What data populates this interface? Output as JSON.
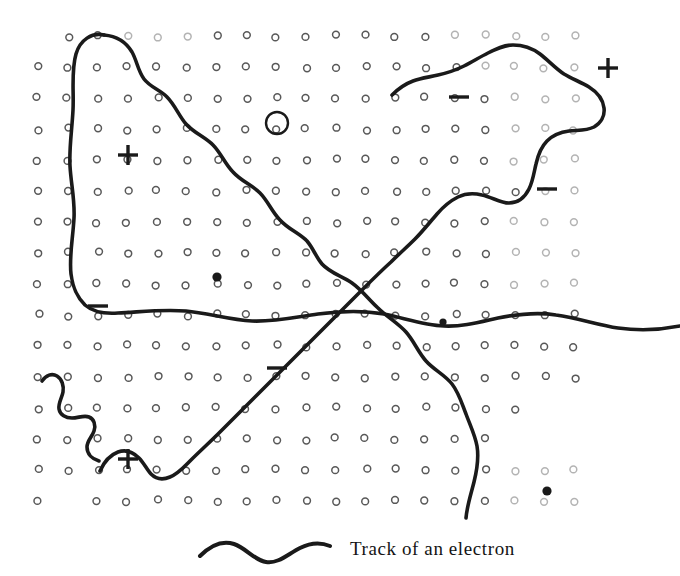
{
  "figure": {
    "title": "Track of an electron",
    "caption": "Track of an electron",
    "background_color": "#ffffff",
    "ink_color": "#1a1a1a",
    "grain_color": "#555555"
  },
  "emulsion_grid": {
    "description": "Photographic emulsion grain lattice of small open circles",
    "columns": 19,
    "rows": 16,
    "origin_x": 38,
    "origin_y": 36,
    "step_x": 29.8,
    "step_y": 31.0,
    "grain_radius": 3.4,
    "grain_stroke": 1.5,
    "grain_color": "#4a4a4a",
    "missing_cells": [
      [
        0,
        0
      ],
      [
        1,
        15
      ],
      [
        17,
        12
      ],
      [
        18,
        12
      ],
      [
        16,
        13
      ],
      [
        17,
        13
      ],
      [
        18,
        13
      ]
    ],
    "faded_cells": [
      [
        14,
        0
      ],
      [
        15,
        0
      ],
      [
        16,
        0
      ],
      [
        17,
        0
      ],
      [
        18,
        0
      ],
      [
        15,
        1
      ],
      [
        16,
        1
      ],
      [
        17,
        1
      ],
      [
        18,
        1
      ],
      [
        16,
        2
      ],
      [
        17,
        2
      ],
      [
        18,
        2
      ],
      [
        16,
        3
      ],
      [
        17,
        3
      ],
      [
        18,
        3
      ],
      [
        16,
        4
      ],
      [
        17,
        4
      ],
      [
        18,
        4
      ],
      [
        17,
        5
      ],
      [
        18,
        5
      ],
      [
        16,
        6
      ],
      [
        17,
        6
      ],
      [
        18,
        6
      ],
      [
        16,
        7
      ],
      [
        17,
        7
      ],
      [
        18,
        7
      ],
      [
        16,
        8
      ],
      [
        17,
        8
      ],
      [
        18,
        8
      ],
      [
        3,
        0
      ],
      [
        4,
        0
      ],
      [
        5,
        0
      ],
      [
        16,
        14
      ],
      [
        17,
        14
      ],
      [
        18,
        14
      ],
      [
        16,
        15
      ],
      [
        17,
        15
      ],
      [
        18,
        15
      ]
    ]
  },
  "markers": [
    {
      "id": "plus-upper-left",
      "symbol": "+",
      "label": "plus-sign",
      "x": 128,
      "y": 155,
      "size": 20
    },
    {
      "id": "plus-upper-right",
      "symbol": "+",
      "label": "plus-sign",
      "x": 608,
      "y": 68,
      "size": 20
    },
    {
      "id": "plus-lower-left",
      "symbol": "+",
      "label": "plus-sign",
      "x": 128,
      "y": 459,
      "size": 20
    },
    {
      "id": "minus-upper-mid",
      "symbol": "−",
      "label": "minus-sign",
      "x": 459,
      "y": 97,
      "size": 20
    },
    {
      "id": "minus-right",
      "symbol": "−",
      "label": "minus-sign",
      "x": 547,
      "y": 189,
      "size": 20
    },
    {
      "id": "minus-left",
      "symbol": "−",
      "label": "minus-sign",
      "x": 98,
      "y": 306,
      "size": 20
    },
    {
      "id": "minus-center-low",
      "symbol": "−",
      "label": "minus-sign",
      "x": 277,
      "y": 368,
      "size": 20
    },
    {
      "id": "dot-upper-left",
      "symbol": "●",
      "label": "developed-grain",
      "x": 217,
      "y": 277,
      "r": 4.6
    },
    {
      "id": "dot-center-right",
      "symbol": "●",
      "label": "developed-grain",
      "x": 443,
      "y": 322,
      "r": 3.6
    },
    {
      "id": "dot-lower-right",
      "symbol": "●",
      "label": "developed-grain",
      "x": 547,
      "y": 491,
      "r": 4.6
    },
    {
      "id": "big-circle",
      "symbol": "○",
      "label": "large-open-grain",
      "x": 277,
      "y": 123,
      "r": 11.0
    }
  ],
  "tracks": [
    {
      "id": "track-left-loop",
      "label": "electron-track-left-loop",
      "stroke_width": 3.6,
      "path": "M 104 35 C 92 32 80 40 76 54 C 71 71 74 92 73 110 C 72 130 69 148 70 166 C 71 184 75 200 74 218 C 73 238 69 256 71 274 C 73 290 78 298 85 305 C 93 312 104 314 118 313 C 140 312 162 309 186 311 C 208 313 230 320 252 321 C 274 322 296 317 318 314 C 340 311 362 310 384 314 C 404 318 424 325 444 326 C 462 327 480 322 498 318 C 518 314 538 312 556 315 C 578 318 598 325 618 328 C 640 331 660 330 680 326"
    },
    {
      "id": "track-main-diagonal",
      "label": "electron-track-main-diagonal",
      "stroke_width": 3.6,
      "path": "M 104 35 C 116 36 126 42 132 52 C 137 61 138 71 144 79 C 150 87 160 90 167 97 C 175 105 179 116 186 124 C 194 133 205 137 213 145 C 221 153 225 164 233 172 C 241 181 252 185 260 193 C 268 201 272 212 280 220 C 288 229 299 233 307 241 C 313 248 316 257 322 264 C 330 273 342 276 352 283 C 362 290 369 300 378 308 C 387 317 398 323 406 332 C 414 341 418 352 426 361 C 434 370 445 375 452 384 C 459 393 462 404 466 414 C 470 425 475 435 477 446 C 479 458 477 470 474 482 C 471 494 467 506 466 518"
    },
    {
      "id": "track-rising-diagonal",
      "label": "electron-track-rising-diagonal",
      "stroke_width": 3.6,
      "path": "M 100 471 C 104 462 110 455 118 452 C 126 449 133 452 139 458 C 144 463 147 470 151 474 C 156 479 163 480 170 477 C 178 474 184 467 191 460 C 200 451 209 443 218 434 C 228 424 237 415 247 405 C 257 395 266 386 276 376 C 286 366 295 357 305 347 C 315 337 324 328 334 318 C 344 308 353 299 363 289 C 372 280 381 271 391 262 C 399 254 407 247 415 239 C 423 231 430 222 437 214 C 443 207 450 201 458 197 C 466 193 474 193 482 195 C 492 197 500 203 509 203 C 518 203 525 197 529 189 C 533 181 534 172 536 164 C 538 155 541 147 547 141 C 553 135 561 132 569 131 C 578 130 586 131 594 127 C 601 123 605 116 604 108 C 603 99 597 92 589 87 C 581 82 572 79 564 74 C 555 68 548 60 540 54 C 532 48 522 45 513 45 C 504 45 496 49 488 53 C 480 57 472 62 464 66 C 456 70 447 73 438 75 C 430 77 421 78 413 81 C 405 84 398 89 392 95"
    },
    {
      "id": "track-left-squiggle",
      "label": "electron-track-left-squiggle",
      "stroke_width": 3.6,
      "path": "M 42 381 C 46 375 52 373 57 376 C 62 379 64 386 63 392 C 62 398 58 403 59 409 C 60 415 66 418 72 418 C 78 418 84 415 89 417 C 94 419 96 425 94 431 C 92 437 87 441 87 447 C 87 454 92 459 99 461"
    }
  ],
  "caption_sample": {
    "id": "caption-sample-curve",
    "label": "sample-track-swatch",
    "stroke_width": 4.0,
    "path": "M 4 24 C 14 14 26 8 38 12 C 50 16 58 28 70 30 C 82 32 92 22 104 16 C 114 11 124 10 134 14"
  }
}
